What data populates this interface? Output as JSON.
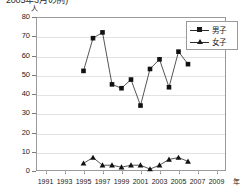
{
  "caption": "2005年3月の例)",
  "axes": {
    "y_unit": "人",
    "x_unit": "年",
    "y_ticks": [
      "0",
      "10",
      "20",
      "30",
      "40",
      "50",
      "60",
      "70",
      "80"
    ],
    "x_ticks": [
      "1991",
      "1993",
      "1995",
      "1997",
      "1999",
      "2001",
      "2003",
      "2005",
      "2007",
      "2009"
    ]
  },
  "legend": {
    "items": [
      {
        "label": "男子",
        "marker": "square-marker"
      },
      {
        "label": "女子",
        "marker": "triangle-marker"
      }
    ]
  },
  "chart_data": {
    "type": "line",
    "title": "2005年3月の例)",
    "xlabel": "年",
    "ylabel": "人",
    "xlim": [
      1990,
      2010
    ],
    "ylim": [
      0,
      80
    ],
    "grid": true,
    "legend_position": "top-right",
    "x": [
      1995,
      1996,
      1997,
      1998,
      1999,
      2000,
      2001,
      2002,
      2003,
      2004,
      2005,
      2006
    ],
    "categories": [
      "1995",
      "1996",
      "1997",
      "1998",
      "1999",
      "2000",
      "2001",
      "2002",
      "2003",
      "2004",
      "2005",
      "2006"
    ],
    "series": [
      {
        "name": "男子",
        "marker": "square",
        "values": [
          52,
          69,
          72,
          45,
          43,
          47.5,
          34,
          53,
          58,
          43.5,
          62,
          55.5
        ]
      },
      {
        "name": "女子",
        "marker": "triangle",
        "values": [
          4,
          7,
          3,
          3,
          2,
          3,
          3,
          1,
          3,
          6,
          7,
          5
        ]
      }
    ]
  }
}
